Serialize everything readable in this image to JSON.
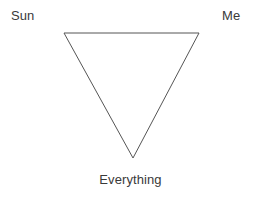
{
  "diagram": {
    "type": "triangle-diagram",
    "background_color": "#ffffff",
    "stroke_color": "#555555",
    "text_color": "#3a3a3a",
    "shape": {
      "name": "downward-triangle",
      "points": "64,33 199,33 133,158",
      "fill": "none",
      "stroke_width": "1"
    },
    "labels": {
      "top_left": "Sun",
      "top_right": "Me",
      "bottom_center": "Everything"
    }
  }
}
